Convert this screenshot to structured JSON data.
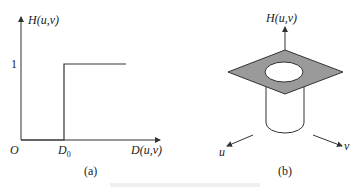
{
  "figure": {
    "panel_a": {
      "caption": "(a)",
      "y_axis_label": "H(u,v)",
      "x_axis_label": "D(u,v)",
      "origin_label": "O",
      "y_tick_label": "1",
      "x_tick_label_main": "D",
      "x_tick_label_sub": "0",
      "description": "Ideal highpass filter transfer function: H=0 for D<D0, H=1 for D>=D0"
    },
    "panel_b": {
      "caption": "(b)",
      "vertical_axis_label": "H(u,v)",
      "u_axis_label": "u",
      "v_axis_label": "v",
      "description": "3D perspective plot of ideal highpass filter: flat plane at height 1 with a cylindrical hole at center"
    },
    "colors": {
      "line": "#333333",
      "plane_fill": "#9a9a9a",
      "background": "#ffffff"
    }
  }
}
